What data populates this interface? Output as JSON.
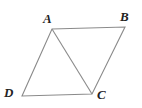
{
  "figure": {
    "kind": "geometry-diagram",
    "shape": "parallelogram-with-diagonal",
    "background_color": "#ffffff",
    "stroke_color": "#8a8a8a",
    "stroke_width": 1.1,
    "label_color": "#232323",
    "vertices": [
      {
        "id": "A",
        "label": "A",
        "x": 52,
        "y": 29,
        "label_x": 43,
        "label_y": 12
      },
      {
        "id": "B",
        "label": "B",
        "x": 125,
        "y": 27,
        "label_x": 120,
        "label_y": 10
      },
      {
        "id": "C",
        "label": "C",
        "x": 92,
        "y": 94,
        "label_x": 97,
        "label_y": 88
      },
      {
        "id": "D",
        "label": "D",
        "x": 22,
        "y": 96,
        "label_x": 4,
        "label_y": 86
      }
    ],
    "edges": [
      {
        "id": "AB",
        "from": "A",
        "to": "B",
        "type": "side"
      },
      {
        "id": "BC",
        "from": "B",
        "to": "C",
        "type": "side"
      },
      {
        "id": "CD",
        "from": "C",
        "to": "D",
        "type": "side"
      },
      {
        "id": "DA",
        "from": "D",
        "to": "A",
        "type": "side"
      },
      {
        "id": "AC",
        "from": "A",
        "to": "C",
        "type": "diagonal"
      }
    ],
    "polygon_points": "52,29 125,27 92,94 22,96",
    "diagonal_points": "52,29 92,94"
  }
}
